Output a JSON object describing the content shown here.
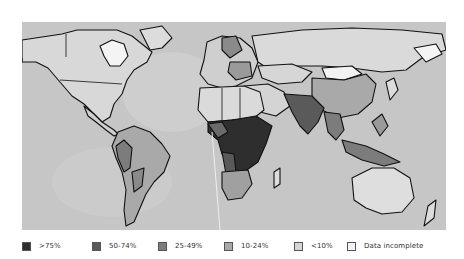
{
  "map": {
    "type": "world-choropleth",
    "ocean_color": "#c9c9c9",
    "land_default_color": "#dcdcdc",
    "regions": [
      {
        "name": "Central/Southern Africa",
        "category": ">75%"
      },
      {
        "name": "Southern Africa (South)",
        "category": "25-49%"
      },
      {
        "name": "South Asia",
        "category": "50-74%"
      },
      {
        "name": "China",
        "category": "10-24%"
      },
      {
        "name": "Southeast Asia",
        "category": "25-49%"
      },
      {
        "name": "Eastern Europe",
        "category": "25-49%"
      },
      {
        "name": "Andean South America",
        "category": "25-49%"
      },
      {
        "name": "Brazil",
        "category": "10-24%"
      },
      {
        "name": "North America",
        "category": "<10%"
      },
      {
        "name": "Australia",
        "category": "<10%"
      },
      {
        "name": "Russia",
        "category": "<10%"
      },
      {
        "name": "Greenland",
        "category": "Data incomplete"
      },
      {
        "name": "Mongolia",
        "category": "Data incomplete"
      }
    ]
  },
  "legend": {
    "items": [
      {
        "label": ">75%",
        "color": "#2e2e2e"
      },
      {
        "label": "50-74%",
        "color": "#5a5a5a"
      },
      {
        "label": "25-49%",
        "color": "#7c7c7c"
      },
      {
        "label": "10-24%",
        "color": "#a9a9a9"
      },
      {
        "label": "<10%",
        "color": "#d6d6d6"
      },
      {
        "label": "Data incomplete",
        "color": "#f2f2f2"
      }
    ]
  }
}
